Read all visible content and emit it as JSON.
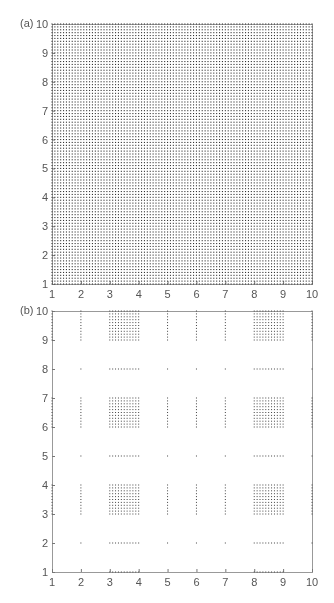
{
  "chart_data": [
    {
      "id": "a",
      "panel_label": "(a)",
      "type": "scatter",
      "title": "",
      "xlabel": "",
      "ylabel": "",
      "xlim": [
        1,
        10
      ],
      "ylim": [
        1,
        10
      ],
      "xticks": [
        "1",
        "2",
        "3",
        "4",
        "5",
        "6",
        "7",
        "8",
        "9",
        "10"
      ],
      "yticks": [
        "1",
        "2",
        "3",
        "4",
        "5",
        "6",
        "7",
        "8",
        "9",
        "10"
      ],
      "grid": false,
      "description": "Full uniform grid of points with spacing 0.1 covering [1,10] x [1,10]",
      "point_spacing": 0.1,
      "x_sets": [
        [
          1,
          10
        ]
      ],
      "y_sets": [
        [
          1,
          10
        ]
      ],
      "extra": []
    },
    {
      "id": "b",
      "panel_label": "(b)",
      "type": "scatter",
      "title": "",
      "xlabel": "",
      "ylabel": "",
      "xlim": [
        1,
        10
      ],
      "ylim": [
        1,
        10
      ],
      "xticks": [
        "1",
        "2",
        "3",
        "4",
        "5",
        "6",
        "7",
        "8",
        "9",
        "10"
      ],
      "yticks": [
        "1",
        "2",
        "3",
        "4",
        "5",
        "6",
        "7",
        "8",
        "9",
        "10"
      ],
      "grid": false,
      "description": "Sparse product-set pattern: dense 11x11 blocks at [3,4]x and [8,9]x combined with [3,4],[6,7],[9,10] in y; isolated columns/points at x=2,5,6,7,10 and rows y=2,5,8",
      "point_spacing": 0.1,
      "x_sets": [
        [
          2,
          2
        ],
        [
          3,
          4
        ],
        [
          5,
          5
        ],
        [
          6,
          6
        ],
        [
          7,
          7
        ],
        [
          8,
          9
        ],
        [
          10,
          10
        ]
      ],
      "y_sets": [
        [
          2,
          2
        ],
        [
          3,
          4
        ],
        [
          5,
          5
        ],
        [
          6,
          7
        ],
        [
          8,
          8
        ],
        [
          9,
          10
        ]
      ],
      "extra": [
        {
          "x": [
            1,
            1
          ],
          "y": [
            3,
            4
          ]
        },
        {
          "x": [
            1,
            1
          ],
          "y": [
            6,
            7
          ]
        },
        {
          "x": [
            1,
            1
          ],
          "y": [
            9,
            10
          ]
        },
        {
          "x": [
            3,
            4
          ],
          "y": [
            1,
            1
          ]
        },
        {
          "x": [
            8,
            9
          ],
          "y": [
            1,
            1
          ]
        }
      ]
    }
  ]
}
